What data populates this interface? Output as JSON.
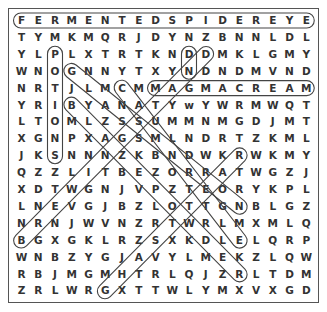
{
  "puzzle": {
    "type": "word-search",
    "cols": 18,
    "rows": 17,
    "grid": [
      "FERMENTEDSPIDEREYE",
      "TYMKMQRJDYNZBNNLDL",
      "YLPLXTRTKNDDMKLGMY",
      "WNOGNNYTXYNDNDMVND",
      "NRTJLMCMMAGMACREAM",
      "YRIBYANATYwYWRMWQT",
      "LTOMLZSSUMMNMGDJMT",
      "XGNPXAGSMLNDRTZKML",
      "JKSNNNZKBNDWKRWKMY",
      "QZZLITBEZORRATWGZJ",
      "XDTWGNJVPZTEORYKPL",
      "LNEVGJBZLOTTGNBLGZ",
      "NRNJWVNZRTWRLMXMLQ",
      "BGXGKLRZSXKDLELQRP",
      "WNBZYGJAVYLMEKZLQW",
      "RBJMGMHTRLQJZRLTDM",
      "ZRLWRGXTTWLYMXVXGD"
    ],
    "found_words": [
      {
        "word": "FERMENTED SPIDER EYE",
        "start": [
          0,
          0
        ],
        "end": [
          0,
          17
        ]
      },
      {
        "word": "MAGMA CREAM",
        "start": [
          4,
          8
        ],
        "end": [
          4,
          17
        ]
      },
      {
        "word": "POTIONS",
        "start": [
          2,
          2
        ],
        "end": [
          8,
          2
        ]
      },
      {
        "word": "DIAGONAL-1",
        "start": [
          2,
          11
        ],
        "end": [
          13,
          0
        ]
      },
      {
        "word": "DIAGONAL-2",
        "start": [
          2,
          10
        ],
        "end": [
          3,
          10
        ]
      },
      {
        "word": "DIAGONAL-3",
        "start": [
          3,
          3
        ],
        "end": [
          11,
          13
        ]
      },
      {
        "word": "DIAGONAL-4",
        "start": [
          4,
          6
        ],
        "end": [
          13,
          13
        ]
      },
      {
        "word": "DIAGONAL-5",
        "start": [
          5,
          3
        ],
        "end": [
          15,
          13
        ]
      },
      {
        "word": "DIAGONAL-6",
        "start": [
          8,
          13
        ],
        "end": [
          16,
          5
        ]
      }
    ],
    "colors": {
      "text": "#333333",
      "border": "#555555",
      "highlight": "#444444"
    }
  }
}
